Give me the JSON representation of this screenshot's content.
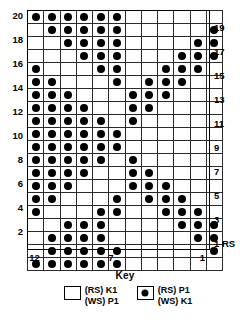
{
  "chart_data": {
    "type": "heatmap",
    "title": "",
    "xlabel": "",
    "ylabel": "",
    "columns": 12,
    "rows": 20,
    "column_numbering": "right-to-left",
    "col_tick_labels": [
      {
        "col": 12,
        "label": "12"
      },
      {
        "col": 7,
        "label": "7"
      },
      {
        "col": 1,
        "label": "1"
      }
    ],
    "row_tick_labels_left": [
      "20",
      "18",
      "16",
      "14",
      "12",
      "10",
      "8",
      "6",
      "4",
      "2"
    ],
    "row_tick_labels_right": [
      "19",
      "17",
      "15",
      "13",
      "11",
      "9",
      "7",
      "5",
      "3",
      "1 RS"
    ],
    "legend": [
      {
        "symbol": "empty-square",
        "label_line1": "(RS) K1",
        "label_line2": "(WS) P1"
      },
      {
        "symbol": "filled-dot",
        "label_line1": "(RS) P1",
        "label_line2": "(WS) K1"
      }
    ],
    "legend_title": "Key",
    "filled_color": "#000000",
    "empty_color": "#ffffff",
    "grid_line_color": "#2b2b2b",
    "note": "grid[r] lists filled column numbers for that row; columns counted 1..12 from the RIGHT edge",
    "grid": [
      {
        "row": 20,
        "filled_cols": [
          12,
          11,
          10,
          9,
          8,
          7
        ]
      },
      {
        "row": 19,
        "filled_cols": [
          11,
          10,
          9,
          8,
          7,
          1
        ]
      },
      {
        "row": 18,
        "filled_cols": [
          10,
          9,
          8,
          7,
          2,
          1
        ]
      },
      {
        "row": 17,
        "filled_cols": [
          9,
          8,
          7,
          3,
          2,
          1
        ]
      },
      {
        "row": 16,
        "filled_cols": [
          12,
          8,
          7,
          4,
          3,
          2
        ]
      },
      {
        "row": 15,
        "filled_cols": [
          12,
          11,
          7,
          5,
          4,
          3
        ]
      },
      {
        "row": 14,
        "filled_cols": [
          12,
          11,
          10,
          6,
          5,
          4
        ]
      },
      {
        "row": 13,
        "filled_cols": [
          12,
          11,
          10,
          9,
          6,
          5
        ]
      },
      {
        "row": 12,
        "filled_cols": [
          12,
          11,
          10,
          9,
          8,
          6
        ]
      },
      {
        "row": 11,
        "filled_cols": [
          12,
          11,
          10,
          9,
          8,
          7
        ]
      },
      {
        "row": 10,
        "filled_cols": [
          12,
          11,
          10,
          9,
          8,
          7
        ]
      },
      {
        "row": 9,
        "filled_cols": [
          12,
          11,
          10,
          9,
          8,
          6
        ]
      },
      {
        "row": 8,
        "filled_cols": [
          12,
          11,
          10,
          9,
          6,
          5
        ]
      },
      {
        "row": 7,
        "filled_cols": [
          12,
          11,
          10,
          6,
          5,
          4
        ]
      },
      {
        "row": 6,
        "filled_cols": [
          12,
          11,
          7,
          5,
          4,
          3
        ]
      },
      {
        "row": 5,
        "filled_cols": [
          12,
          8,
          7,
          4,
          3,
          2
        ]
      },
      {
        "row": 4,
        "filled_cols": [
          10,
          9,
          8,
          3,
          2,
          1
        ]
      },
      {
        "row": 3,
        "filled_cols": [
          11,
          10,
          9,
          8,
          2,
          1
        ]
      },
      {
        "row": 2,
        "filled_cols": [
          11,
          10,
          9,
          8,
          7,
          1
        ]
      },
      {
        "row": 1,
        "filled_cols": [
          12,
          11,
          10,
          9,
          8,
          7
        ]
      }
    ]
  }
}
